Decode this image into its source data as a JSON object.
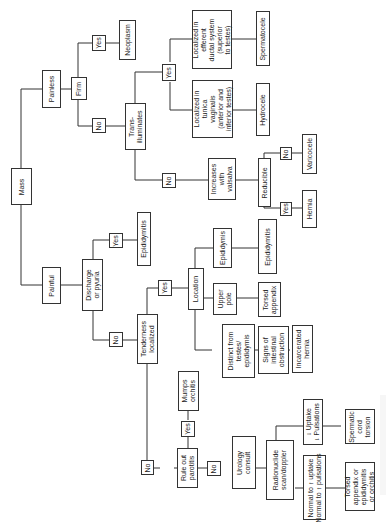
{
  "diagram": {
    "orientation": "rotated 90deg counterclockwise",
    "nodes": {
      "mass": "Mass",
      "painless": "Painless",
      "painful": "Painful",
      "firm": "Firm",
      "firm_yes": "Yes",
      "neoplasm": "Neoplasm",
      "firm_no": "No",
      "transilluminates": "Trans-\nilluminates",
      "trans_yes": "Yes",
      "tunica": "Localized in\ntunica\nvaginalis\n(anterior and\ninferior testes)",
      "hydrocele": "Hydrocele",
      "efferent": "Localized in\nefferent\nductal system\n(superior\nto testes)",
      "spermatocele": "Spermatocele",
      "trans_no": "No",
      "valsalva": "Increases\nwith\nvalsalva",
      "reducible": "Reducible",
      "reducible_no": "No",
      "varicocele": "Varicocele",
      "reducible_yes": "Yes",
      "hernia": "Hernia",
      "discharge": "Discharge\nor pyuria",
      "discharge_yes": "Yes",
      "epididymitis_1": "Epididymitis",
      "discharge_no": "No",
      "tenderness": "Tenderness\nlocalized",
      "tender_yes": "Yes",
      "location": "Location",
      "loc_epididymis": "Epididymis",
      "epididymitis_2": "Epididymitis",
      "upper_pole": "Upper\npole",
      "torsed_appendix": "Torsed\nappendix",
      "distinct": "Distinct from\ntestes/\nepididymis",
      "signs_obstruction": "Signs of\nintestinal\nobstruction",
      "incarcerated": "Incarcerated\nhernia",
      "tender_no": "No",
      "parotitis": "Rule out\nparotitis",
      "parotitis_yes": "Yes",
      "mumps": "Mumps\norchitis",
      "parotitis_no": "No",
      "urology": "Urology\nconsult",
      "radionuclide": "Radionuclide\nscan/doppler",
      "decreased": "↓ Uptake\n↓ Pulsations",
      "spermatic_torsion": "Spermatic\ncord\ntorsion",
      "normal": "Normal to ↑ uptake\nNormal to ↑ pulsations",
      "torsed_app_epi": "Torsed\nappendix or\nepididymitis\nor orchitis"
    }
  }
}
